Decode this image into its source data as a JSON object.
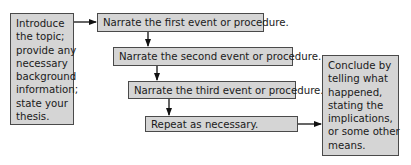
{
  "diagram": {
    "intro_box": {
      "lines": [
        "Introduce",
        "the topic;",
        "provide any",
        "necessary",
        "background",
        "information;",
        "state your",
        "thesis."
      ]
    },
    "steps": [
      {
        "label": "Narrate the first event or procedure."
      },
      {
        "label": "Narrate the second event or procedure."
      },
      {
        "label": "Narrate the third event or procedure."
      },
      {
        "label": "Repeat as necessary."
      }
    ],
    "conclusion_box": {
      "lines": [
        "Conclude by",
        "telling what",
        "happened,",
        "stating the",
        "implications,",
        "or some other",
        "means."
      ]
    },
    "colors": {
      "box_fill": "#d5d5d5",
      "box_border": "#4a4a4a",
      "arrow": "#111111"
    }
  }
}
